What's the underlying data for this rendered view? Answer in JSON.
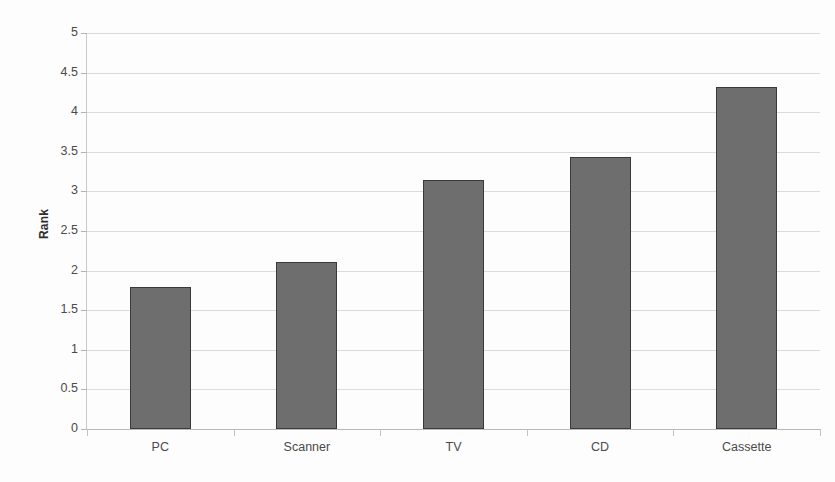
{
  "chart_data": {
    "type": "bar",
    "title": "",
    "xlabel": "",
    "ylabel": "Rank",
    "categories": [
      "PC",
      "Scanner",
      "TV",
      "CD",
      "Cassette"
    ],
    "values": [
      1.79,
      2.11,
      3.14,
      3.43,
      4.32
    ],
    "ylim": [
      0,
      5
    ],
    "ytick_labels": [
      "5",
      "4.5",
      "4",
      "3.5",
      "3",
      "2.5",
      "2",
      "1.5",
      "1",
      "0.5",
      "0"
    ],
    "ytick_values": [
      5,
      4.5,
      4,
      3.5,
      3,
      2.5,
      2,
      1.5,
      1,
      0.5,
      0
    ],
    "grid": true,
    "legend": "none",
    "series": [
      {
        "name": "Rank",
        "values": [
          1.79,
          2.11,
          3.14,
          3.43,
          4.32
        ]
      }
    ],
    "colors": {
      "bar_fill": "#6e6e6e",
      "bar_border": "#3a3a3a",
      "gridline": "#dcdcdc",
      "axis": "#b9b9b9",
      "text": "#4a4a4a",
      "background": "#fdfdfd"
    }
  }
}
